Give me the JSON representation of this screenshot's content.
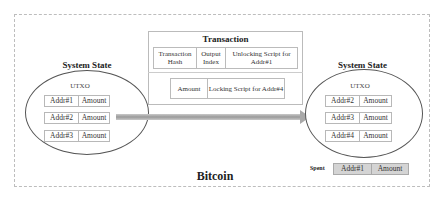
{
  "diagram": {
    "title": "Bitcoin",
    "colors": {
      "frame": "#bdbdbd",
      "arrow": "#a9a9a9",
      "spent_fill": "#d4d4d4",
      "cell_border": "#b8b8b8"
    },
    "left_state": {
      "title": "System State",
      "utxo_label": "UTXO",
      "rows": [
        {
          "address": "Addr#1",
          "amount": "Amount"
        },
        {
          "address": "Addr#2",
          "amount": "Amount"
        },
        {
          "address": "Addr#3",
          "amount": "Amount"
        }
      ]
    },
    "transaction": {
      "title": "Transaction",
      "inputs": [
        "Transaction Hash",
        "Output Index",
        "Unlocking Script for Addr#1"
      ],
      "outputs": [
        "Amount",
        "Locking Script for Addr#4"
      ]
    },
    "right_state": {
      "title": "System State",
      "utxo_label": "UTXO",
      "rows": [
        {
          "address": "Addr#2",
          "amount": "Amount"
        },
        {
          "address": "Addr#3",
          "amount": "Amount"
        },
        {
          "address": "Addr#4",
          "amount": "Amount"
        }
      ]
    },
    "spent": {
      "label": "Spent",
      "address": "Addr#1",
      "amount": "Amount"
    }
  }
}
